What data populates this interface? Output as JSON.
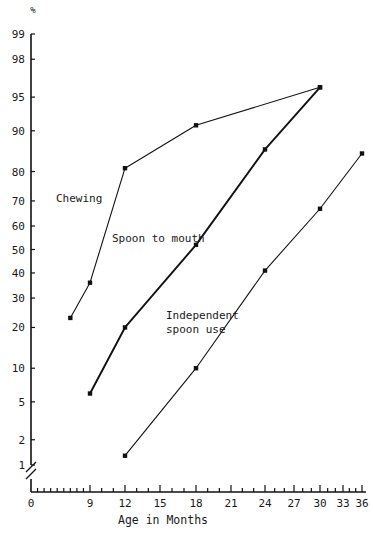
{
  "chart_data": {
    "type": "line",
    "title": "",
    "subtitle": "",
    "xlabel": "Age in Months",
    "ylabel": "",
    "y_unit_symbol": "%",
    "x_scale": "compressed",
    "y_scale": "normal-probability (probit)",
    "grid": false,
    "legend_position": "inline-annotations",
    "x_tick_labels": [
      "0",
      "9",
      "12",
      "15",
      "18",
      "21",
      "24",
      "27",
      "30",
      "33",
      "36"
    ],
    "x_tick_values": [
      0,
      9,
      12,
      15,
      18,
      21,
      24,
      27,
      30,
      33,
      36
    ],
    "y_tick_labels": [
      "1",
      "2",
      "5",
      "10",
      "20",
      "30",
      "40",
      "50",
      "60",
      "70",
      "80",
      "90",
      "95",
      "98",
      "99"
    ],
    "y_tick_values": [
      1,
      2,
      5,
      10,
      20,
      30,
      40,
      50,
      60,
      70,
      80,
      90,
      95,
      98,
      99
    ],
    "xlim": [
      0,
      36
    ],
    "ylim": [
      1,
      99
    ],
    "axis_break": "y-axis break below 1%",
    "series": [
      {
        "name": "Chewing",
        "label": "Chewing",
        "x": [
          6,
          9,
          12,
          18,
          30
        ],
        "values": [
          23,
          36,
          81,
          91,
          96
        ]
      },
      {
        "name": "Spoon to mouth",
        "label": "Spoon to mouth",
        "x": [
          9,
          12,
          18,
          24,
          30
        ],
        "values": [
          6,
          20,
          52,
          86,
          96
        ]
      },
      {
        "name": "Independent spoon use",
        "label": "Independent\nspoon use",
        "label_line1": "Independent",
        "label_line2": "spoon use",
        "x": [
          12,
          18,
          24,
          30,
          36
        ],
        "values": [
          1.3,
          10,
          41,
          67,
          85
        ]
      }
    ]
  },
  "colors": {
    "ink": "#111111",
    "background": "#ffffff"
  }
}
